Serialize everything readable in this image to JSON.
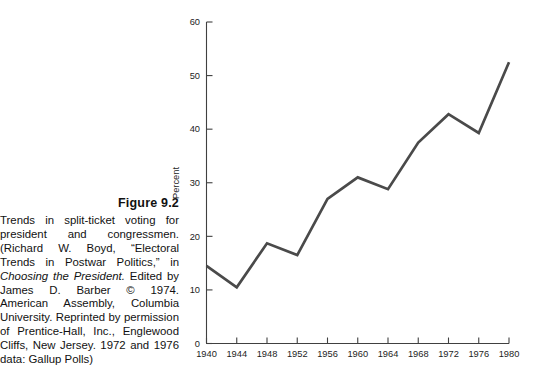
{
  "caption": {
    "figure_number": "Figure 9.2",
    "body_plain": "Trends in split-ticket voting for president and congressmen. (Richard W. Boyd, “Electoral Trends in Postwar Politics,” in Choosing the President. Edited by James D. Barber © 1974. American Assembly, Columbia University. Reprinted by permission of Prentice-Hall, Inc., Englewood Cliffs, New Jersey. 1972 and 1976 data: Gallup Polls)",
    "segments": {
      "part1": "Trends in split-ticket voting for president and congressmen. (Richard W. Boyd, “Electoral Trends in Postwar Politics,” in ",
      "part2_italic": "Choosing the President.",
      "part3": " Edited by James D. Barber © 1974. American Assembly, Columbia University. Reprinted by permission of Prentice-Hall, Inc., Englewood Cliffs, New Jersey. 1972 and 1976 data: Gallup Polls)"
    }
  },
  "chart_data": {
    "type": "line",
    "title": "",
    "xlabel": "",
    "ylabel": "Percent",
    "x": [
      1940,
      1944,
      1948,
      1952,
      1956,
      1960,
      1964,
      1968,
      1972,
      1976,
      1980
    ],
    "values": [
      14.5,
      10.5,
      18.7,
      16.5,
      27.0,
      31.0,
      28.8,
      37.5,
      42.8,
      39.3,
      52.5
    ],
    "xtick_labels": [
      "1940",
      "1944",
      "1948",
      "1952",
      "1956",
      "1960",
      "1964",
      "1968",
      "1972",
      "1976",
      "1980"
    ],
    "ytick_labels": [
      "0",
      "10",
      "20",
      "30",
      "40",
      "50",
      "60"
    ],
    "yticks": [
      0,
      10,
      20,
      30,
      40,
      50,
      60
    ],
    "xlim": [
      1940,
      1980
    ],
    "ylim": [
      0,
      60
    ],
    "grid": false,
    "legend": false,
    "line_color": "#4a4a4a",
    "axis_color": "#404040"
  }
}
